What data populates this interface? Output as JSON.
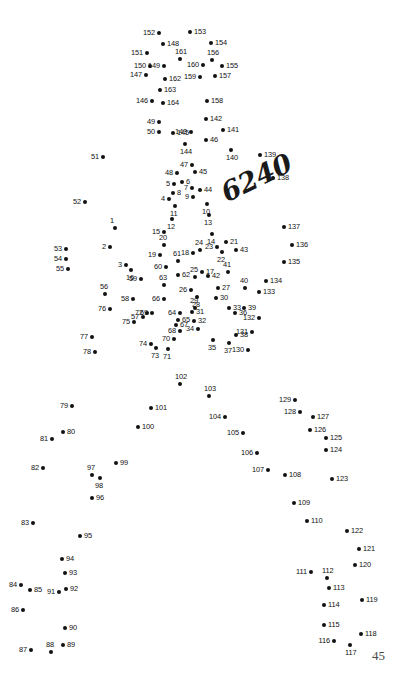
{
  "page": {
    "page_number": "45",
    "watermark": "6240",
    "width": 408,
    "height": 692,
    "dot_color": "#111111",
    "background_color": "#ffffff"
  },
  "puzzle": {
    "type": "connect-the-dots",
    "total_dots": 164,
    "dots": [
      {
        "n": "1",
        "x": 115,
        "y": 228,
        "pos": "above"
      },
      {
        "n": "2",
        "x": 110,
        "y": 247,
        "pos": "left"
      },
      {
        "n": "3",
        "x": 126,
        "y": 265,
        "pos": "left"
      },
      {
        "n": "4",
        "x": 169,
        "y": 199,
        "pos": "left"
      },
      {
        "n": "5",
        "x": 174,
        "y": 184,
        "pos": "left"
      },
      {
        "n": "6",
        "x": 182,
        "y": 182,
        "pos": "right"
      },
      {
        "n": "7",
        "x": 192,
        "y": 188,
        "pos": "left"
      },
      {
        "n": "8",
        "x": 173,
        "y": 193,
        "pos": "right"
      },
      {
        "n": "9",
        "x": 193,
        "y": 197,
        "pos": "left"
      },
      {
        "n": "10",
        "x": 207,
        "y": 204,
        "pos": "below"
      },
      {
        "n": "11",
        "x": 175,
        "y": 206,
        "pos": "below"
      },
      {
        "n": "12",
        "x": 172,
        "y": 219,
        "pos": "below"
      },
      {
        "n": "13",
        "x": 209,
        "y": 215,
        "pos": "below"
      },
      {
        "n": "14",
        "x": 212,
        "y": 234,
        "pos": "below"
      },
      {
        "n": "15",
        "x": 164,
        "y": 232,
        "pos": "left"
      },
      {
        "n": "16",
        "x": 131,
        "y": 270,
        "pos": "below"
      },
      {
        "n": "17",
        "x": 202,
        "y": 272,
        "pos": "right"
      },
      {
        "n": "18",
        "x": 193,
        "y": 253,
        "pos": "left"
      },
      {
        "n": "19",
        "x": 160,
        "y": 255,
        "pos": "left"
      },
      {
        "n": "20",
        "x": 164,
        "y": 245,
        "pos": "above"
      },
      {
        "n": "21",
        "x": 226,
        "y": 242,
        "pos": "right"
      },
      {
        "n": "22",
        "x": 222,
        "y": 252,
        "pos": "below"
      },
      {
        "n": "23",
        "x": 217,
        "y": 247,
        "pos": "left"
      },
      {
        "n": "24",
        "x": 200,
        "y": 250,
        "pos": "above"
      },
      {
        "n": "25",
        "x": 195,
        "y": 277,
        "pos": "above"
      },
      {
        "n": "26",
        "x": 191,
        "y": 290,
        "pos": "left"
      },
      {
        "n": "27",
        "x": 218,
        "y": 288,
        "pos": "right"
      },
      {
        "n": "28",
        "x": 197,
        "y": 297,
        "pos": "below"
      },
      {
        "n": "29",
        "x": 195,
        "y": 308,
        "pos": "above"
      },
      {
        "n": "30",
        "x": 216,
        "y": 298,
        "pos": "right"
      },
      {
        "n": "31",
        "x": 192,
        "y": 312,
        "pos": "right"
      },
      {
        "n": "32",
        "x": 194,
        "y": 321,
        "pos": "right"
      },
      {
        "n": "33",
        "x": 229,
        "y": 308,
        "pos": "right"
      },
      {
        "n": "34",
        "x": 198,
        "y": 329,
        "pos": "left"
      },
      {
        "n": "35",
        "x": 213,
        "y": 340,
        "pos": "below"
      },
      {
        "n": "36",
        "x": 235,
        "y": 313,
        "pos": "right"
      },
      {
        "n": "37",
        "x": 229,
        "y": 343,
        "pos": "below"
      },
      {
        "n": "38",
        "x": 236,
        "y": 335,
        "pos": "right"
      },
      {
        "n": "39",
        "x": 244,
        "y": 308,
        "pos": "right"
      },
      {
        "n": "40",
        "x": 245,
        "y": 288,
        "pos": "above"
      },
      {
        "n": "41",
        "x": 228,
        "y": 272,
        "pos": "above"
      },
      {
        "n": "42",
        "x": 208,
        "y": 276,
        "pos": "right"
      },
      {
        "n": "43",
        "x": 236,
        "y": 250,
        "pos": "right"
      },
      {
        "n": "44",
        "x": 200,
        "y": 190,
        "pos": "right"
      },
      {
        "n": "45",
        "x": 195,
        "y": 172,
        "pos": "right"
      },
      {
        "n": "46",
        "x": 206,
        "y": 140,
        "pos": "right"
      },
      {
        "n": "47",
        "x": 192,
        "y": 165,
        "pos": "left"
      },
      {
        "n": "48",
        "x": 177,
        "y": 173,
        "pos": "left"
      },
      {
        "n": "49",
        "x": 159,
        "y": 122,
        "pos": "left"
      },
      {
        "n": "50",
        "x": 159,
        "y": 132,
        "pos": "left"
      },
      {
        "n": "51",
        "x": 103,
        "y": 157,
        "pos": "left"
      },
      {
        "n": "52",
        "x": 85,
        "y": 202,
        "pos": "left"
      },
      {
        "n": "53",
        "x": 66,
        "y": 249,
        "pos": "left"
      },
      {
        "n": "54",
        "x": 66,
        "y": 259,
        "pos": "left"
      },
      {
        "n": "55",
        "x": 68,
        "y": 269,
        "pos": "left"
      },
      {
        "n": "56",
        "x": 105,
        "y": 294,
        "pos": "above"
      },
      {
        "n": "57",
        "x": 143,
        "y": 317,
        "pos": "left"
      },
      {
        "n": "58",
        "x": 133,
        "y": 299,
        "pos": "left"
      },
      {
        "n": "59",
        "x": 141,
        "y": 279,
        "pos": "left"
      },
      {
        "n": "60",
        "x": 166,
        "y": 267,
        "pos": "left"
      },
      {
        "n": "61",
        "x": 178,
        "y": 261,
        "pos": "above"
      },
      {
        "n": "62",
        "x": 178,
        "y": 275,
        "pos": "right"
      },
      {
        "n": "63",
        "x": 164,
        "y": 285,
        "pos": "above"
      },
      {
        "n": "64",
        "x": 180,
        "y": 313,
        "pos": "left"
      },
      {
        "n": "65",
        "x": 178,
        "y": 320,
        "pos": "right"
      },
      {
        "n": "66",
        "x": 164,
        "y": 299,
        "pos": "left"
      },
      {
        "n": "67",
        "x": 176,
        "y": 325,
        "pos": "right"
      },
      {
        "n": "68",
        "x": 180,
        "y": 331,
        "pos": "left"
      },
      {
        "n": "69",
        "x": 152,
        "y": 313,
        "pos": "left"
      },
      {
        "n": "70",
        "x": 174,
        "y": 339,
        "pos": "left"
      },
      {
        "n": "71",
        "x": 168,
        "y": 349,
        "pos": "below"
      },
      {
        "n": "72",
        "x": 147,
        "y": 313,
        "pos": "left"
      },
      {
        "n": "73",
        "x": 156,
        "y": 348,
        "pos": "below"
      },
      {
        "n": "74",
        "x": 151,
        "y": 344,
        "pos": "left"
      },
      {
        "n": "75",
        "x": 134,
        "y": 322,
        "pos": "left"
      },
      {
        "n": "76",
        "x": 110,
        "y": 309,
        "pos": "left"
      },
      {
        "n": "77",
        "x": 92,
        "y": 337,
        "pos": "left"
      },
      {
        "n": "78",
        "x": 95,
        "y": 352,
        "pos": "left"
      },
      {
        "n": "79",
        "x": 72,
        "y": 406,
        "pos": "left"
      },
      {
        "n": "80",
        "x": 63,
        "y": 432,
        "pos": "right"
      },
      {
        "n": "81",
        "x": 52,
        "y": 439,
        "pos": "left"
      },
      {
        "n": "82",
        "x": 43,
        "y": 468,
        "pos": "left"
      },
      {
        "n": "83",
        "x": 33,
        "y": 523,
        "pos": "left"
      },
      {
        "n": "84",
        "x": 21,
        "y": 585,
        "pos": "left"
      },
      {
        "n": "85",
        "x": 30,
        "y": 590,
        "pos": "right"
      },
      {
        "n": "86",
        "x": 23,
        "y": 610,
        "pos": "left"
      },
      {
        "n": "87",
        "x": 31,
        "y": 650,
        "pos": "left"
      },
      {
        "n": "88",
        "x": 51,
        "y": 652,
        "pos": "above"
      },
      {
        "n": "89",
        "x": 63,
        "y": 645,
        "pos": "right"
      },
      {
        "n": "90",
        "x": 65,
        "y": 628,
        "pos": "right"
      },
      {
        "n": "91",
        "x": 59,
        "y": 592,
        "pos": "left"
      },
      {
        "n": "92",
        "x": 66,
        "y": 589,
        "pos": "right"
      },
      {
        "n": "93",
        "x": 65,
        "y": 573,
        "pos": "right"
      },
      {
        "n": "94",
        "x": 62,
        "y": 559,
        "pos": "right"
      },
      {
        "n": "95",
        "x": 80,
        "y": 536,
        "pos": "right"
      },
      {
        "n": "96",
        "x": 92,
        "y": 498,
        "pos": "right"
      },
      {
        "n": "97",
        "x": 92,
        "y": 475,
        "pos": "above"
      },
      {
        "n": "98",
        "x": 100,
        "y": 478,
        "pos": "below"
      },
      {
        "n": "99",
        "x": 116,
        "y": 463,
        "pos": "right"
      },
      {
        "n": "100",
        "x": 138,
        "y": 427,
        "pos": "right"
      },
      {
        "n": "101",
        "x": 151,
        "y": 408,
        "pos": "right"
      },
      {
        "n": "102",
        "x": 180,
        "y": 384,
        "pos": "above"
      },
      {
        "n": "103",
        "x": 209,
        "y": 396,
        "pos": "above"
      },
      {
        "n": "104",
        "x": 225,
        "y": 417,
        "pos": "left"
      },
      {
        "n": "105",
        "x": 243,
        "y": 433,
        "pos": "left"
      },
      {
        "n": "106",
        "x": 257,
        "y": 453,
        "pos": "left"
      },
      {
        "n": "107",
        "x": 268,
        "y": 470,
        "pos": "left"
      },
      {
        "n": "108",
        "x": 285,
        "y": 475,
        "pos": "right"
      },
      {
        "n": "109",
        "x": 294,
        "y": 503,
        "pos": "right"
      },
      {
        "n": "110",
        "x": 307,
        "y": 521,
        "pos": "right"
      },
      {
        "n": "111",
        "x": 311,
        "y": 572,
        "pos": "left"
      },
      {
        "n": "112",
        "x": 327,
        "y": 578,
        "pos": "above"
      },
      {
        "n": "113",
        "x": 329,
        "y": 588,
        "pos": "right"
      },
      {
        "n": "114",
        "x": 324,
        "y": 605,
        "pos": "right"
      },
      {
        "n": "115",
        "x": 324,
        "y": 625,
        "pos": "right"
      },
      {
        "n": "116",
        "x": 334,
        "y": 641,
        "pos": "left"
      },
      {
        "n": "117",
        "x": 350,
        "y": 645,
        "pos": "below"
      },
      {
        "n": "118",
        "x": 361,
        "y": 634,
        "pos": "right"
      },
      {
        "n": "119",
        "x": 362,
        "y": 600,
        "pos": "right"
      },
      {
        "n": "120",
        "x": 355,
        "y": 565,
        "pos": "right"
      },
      {
        "n": "121",
        "x": 359,
        "y": 549,
        "pos": "right"
      },
      {
        "n": "122",
        "x": 347,
        "y": 531,
        "pos": "right"
      },
      {
        "n": "123",
        "x": 332,
        "y": 479,
        "pos": "right"
      },
      {
        "n": "124",
        "x": 326,
        "y": 450,
        "pos": "right"
      },
      {
        "n": "125",
        "x": 326,
        "y": 438,
        "pos": "right"
      },
      {
        "n": "126",
        "x": 310,
        "y": 430,
        "pos": "right"
      },
      {
        "n": "127",
        "x": 313,
        "y": 417,
        "pos": "right"
      },
      {
        "n": "128",
        "x": 300,
        "y": 412,
        "pos": "left"
      },
      {
        "n": "129",
        "x": 295,
        "y": 400,
        "pos": "left"
      },
      {
        "n": "130",
        "x": 248,
        "y": 350,
        "pos": "left"
      },
      {
        "n": "131",
        "x": 252,
        "y": 332,
        "pos": "left"
      },
      {
        "n": "132",
        "x": 259,
        "y": 318,
        "pos": "left"
      },
      {
        "n": "133",
        "x": 259,
        "y": 292,
        "pos": "right"
      },
      {
        "n": "134",
        "x": 266,
        "y": 281,
        "pos": "right"
      },
      {
        "n": "135",
        "x": 284,
        "y": 262,
        "pos": "right"
      },
      {
        "n": "136",
        "x": 292,
        "y": 245,
        "pos": "right"
      },
      {
        "n": "137",
        "x": 284,
        "y": 227,
        "pos": "right"
      },
      {
        "n": "138",
        "x": 273,
        "y": 178,
        "pos": "right"
      },
      {
        "n": "139",
        "x": 260,
        "y": 155,
        "pos": "right"
      },
      {
        "n": "140",
        "x": 231,
        "y": 150,
        "pos": "below"
      },
      {
        "n": "141",
        "x": 223,
        "y": 130,
        "pos": "right"
      },
      {
        "n": "142",
        "x": 206,
        "y": 119,
        "pos": "right"
      },
      {
        "n": "143",
        "x": 191,
        "y": 132,
        "pos": "left"
      },
      {
        "n": "144",
        "x": 185,
        "y": 144,
        "pos": "below"
      },
      {
        "n": "145",
        "x": 173,
        "y": 133,
        "pos": "right"
      },
      {
        "n": "146",
        "x": 152,
        "y": 101,
        "pos": "left"
      },
      {
        "n": "147",
        "x": 146,
        "y": 75,
        "pos": "left"
      },
      {
        "n": "148",
        "x": 163,
        "y": 44,
        "pos": "right"
      },
      {
        "n": "149",
        "x": 164,
        "y": 66,
        "pos": "left"
      },
      {
        "n": "150",
        "x": 150,
        "y": 66,
        "pos": "left"
      },
      {
        "n": "151",
        "x": 147,
        "y": 53,
        "pos": "left"
      },
      {
        "n": "152",
        "x": 159,
        "y": 33,
        "pos": "left"
      },
      {
        "n": "153",
        "x": 190,
        "y": 32,
        "pos": "right"
      },
      {
        "n": "154",
        "x": 211,
        "y": 43,
        "pos": "right"
      },
      {
        "n": "155",
        "x": 222,
        "y": 66,
        "pos": "right"
      },
      {
        "n": "156",
        "x": 212,
        "y": 60,
        "pos": "above"
      },
      {
        "n": "157",
        "x": 215,
        "y": 76,
        "pos": "right"
      },
      {
        "n": "158",
        "x": 207,
        "y": 101,
        "pos": "right"
      },
      {
        "n": "159",
        "x": 200,
        "y": 77,
        "pos": "left"
      },
      {
        "n": "160",
        "x": 203,
        "y": 65,
        "pos": "left"
      },
      {
        "n": "161",
        "x": 180,
        "y": 59,
        "pos": "above"
      },
      {
        "n": "162",
        "x": 165,
        "y": 79,
        "pos": "right"
      },
      {
        "n": "163",
        "x": 160,
        "y": 90,
        "pos": "right"
      },
      {
        "n": "164",
        "x": 163,
        "y": 103,
        "pos": "right"
      }
    ]
  }
}
